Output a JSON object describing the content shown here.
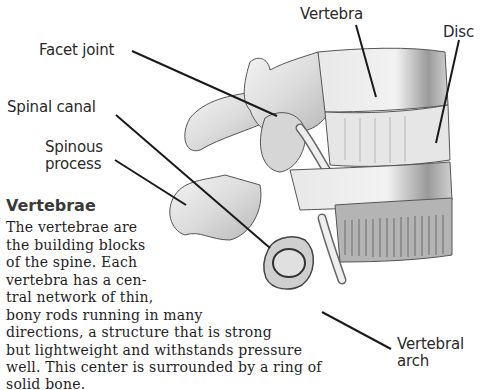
{
  "diagram": {
    "labels": {
      "vertebra": "Vertebra",
      "disc": "Disc",
      "facet_joint": "Facet joint",
      "spinal_canal": "Spinal canal",
      "spinous_process_1": "Spinous",
      "spinous_process_2": "process",
      "vertebral_arch_1": "Vertebral",
      "vertebral_arch_2": "arch"
    }
  },
  "sidebar": {
    "heading": "Vertebrae",
    "lines": [
      "The vertebrae are",
      "the building blocks",
      "of the spine. Each",
      "vertebra has a cen-",
      "tral network of thin,",
      "bony rods running in many",
      "directions, a structure that is strong",
      "but lightweight and withstands pressure",
      "well. This center is surrounded by a ring of",
      "solid bone."
    ]
  }
}
